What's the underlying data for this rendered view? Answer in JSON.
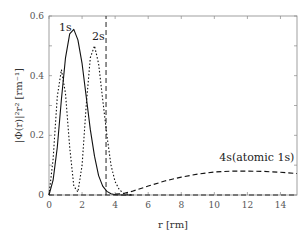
{
  "chart_data": {
    "type": "line",
    "title": "",
    "xlabel": "r [rm]",
    "ylabel": "|Φ(r)|²r² [rm⁻¹]",
    "xlim": [
      0,
      15
    ],
    "ylim": [
      0,
      0.6
    ],
    "xticks": [
      "0",
      "2",
      "4",
      "6",
      "8",
      "10",
      "12",
      "14"
    ],
    "yticks": [
      "0",
      "0.2",
      "0.4",
      "0.6"
    ],
    "grid": false,
    "legend": "none (inline annotations)",
    "annotations": [
      {
        "text": "1s",
        "x": 0.6,
        "y": 0.55
      },
      {
        "text": "2s",
        "x": 2.6,
        "y": 0.52
      },
      {
        "text": "4s(atomic 1s)",
        "x": 10.3,
        "y": 0.115
      }
    ],
    "series": [
      {
        "name": "1s",
        "style": "solid",
        "x": [
          0,
          0.25,
          0.5,
          0.75,
          1.0,
          1.25,
          1.5,
          1.75,
          2.0,
          2.25,
          2.5,
          2.75,
          3.0,
          3.25,
          3.5,
          3.75,
          4.0,
          4.5,
          5.0
        ],
        "y": [
          0,
          0.05,
          0.16,
          0.32,
          0.46,
          0.54,
          0.555,
          0.52,
          0.44,
          0.33,
          0.22,
          0.13,
          0.065,
          0.03,
          0.012,
          0.004,
          0.001,
          0,
          0
        ]
      },
      {
        "name": "2s",
        "style": "dotted",
        "x": [
          0,
          0.25,
          0.5,
          0.75,
          1.0,
          1.25,
          1.5,
          1.75,
          2.0,
          2.25,
          2.5,
          2.75,
          3.0,
          3.25,
          3.5,
          3.75,
          4.0,
          4.25,
          4.5,
          5.0
        ],
        "y": [
          0,
          0.12,
          0.33,
          0.42,
          0.34,
          0.16,
          0.03,
          0.01,
          0.1,
          0.3,
          0.46,
          0.5,
          0.44,
          0.32,
          0.2,
          0.1,
          0.045,
          0.018,
          0.006,
          0
        ]
      },
      {
        "name": "4s(atomic 1s)",
        "style": "dashed",
        "x": [
          0,
          3.45,
          3.45,
          4.0,
          4.5,
          5.0,
          6.0,
          7.0,
          8.0,
          9.0,
          10.0,
          11.0,
          12.0,
          13.0,
          14.0,
          15.0
        ],
        "y": [
          0,
          0,
          0.6,
          0.003,
          0.005,
          0.012,
          0.03,
          0.047,
          0.06,
          0.07,
          0.077,
          0.08,
          0.08,
          0.079,
          0.076,
          0.072
        ]
      }
    ],
    "vertical_line": {
      "x": 3.45,
      "style": "dashed"
    }
  }
}
